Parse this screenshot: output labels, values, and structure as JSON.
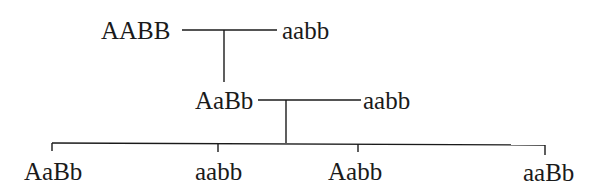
{
  "diagram": {
    "type": "genetic-cross-pedigree",
    "p_generation": {
      "parent_1": "AABB",
      "parent_2": "aabb"
    },
    "f1_generation": {
      "offspring": "AaBb",
      "testcross_partner": "aabb"
    },
    "f2_generation": {
      "offspring": [
        "AaBb",
        "aabb",
        "Aabb",
        "aaBb"
      ]
    }
  }
}
